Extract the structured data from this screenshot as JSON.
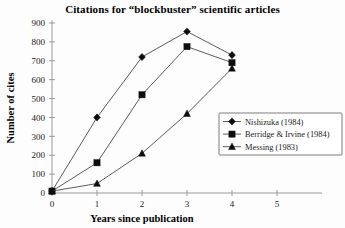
{
  "chart_data": {
    "type": "line",
    "title": "Citations for “blockbuster” scientific articles",
    "xlabel": "Years since publication",
    "ylabel": "Number of cites",
    "x": [
      0,
      1,
      2,
      3,
      4
    ],
    "xlim": [
      0,
      5
    ],
    "ylim": [
      0,
      900
    ],
    "xticks": [
      0,
      1,
      2,
      3,
      4,
      5
    ],
    "yticks": [
      0,
      100,
      200,
      300,
      400,
      500,
      600,
      700,
      800,
      900
    ],
    "xtick_labels": [
      "0",
      "1",
      "2",
      "3",
      "4",
      "5"
    ],
    "ytick_labels": [
      "0",
      "100",
      "200",
      "300",
      "400",
      "500",
      "600",
      "700",
      "800",
      "900"
    ],
    "grid": false,
    "legend_position": "right-middle",
    "series": [
      {
        "name": "Nishizuka (1984)",
        "marker": "diamond",
        "values": [
          10,
          400,
          720,
          855,
          730
        ]
      },
      {
        "name": "Berridge & Irvine (1984)",
        "marker": "square",
        "values": [
          10,
          160,
          520,
          775,
          690
        ]
      },
      {
        "name": "Messing (1983)",
        "marker": "triangle",
        "values": [
          10,
          50,
          210,
          420,
          660
        ]
      }
    ]
  }
}
